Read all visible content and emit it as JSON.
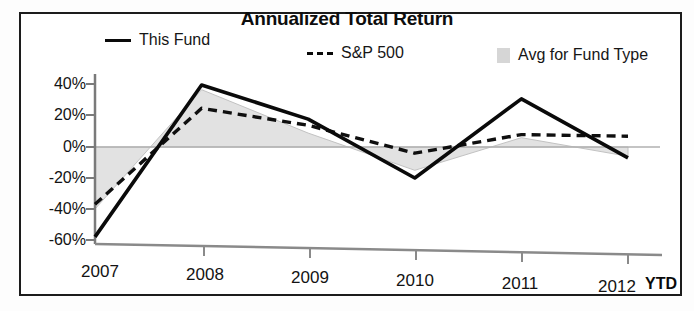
{
  "chart_data": {
    "type": "line",
    "title": "Annualized Total Return",
    "subtitle": "",
    "xlabel": "",
    "ylabel": "",
    "x_axis_note": "YTD",
    "categories": [
      "2007",
      "2008",
      "2009",
      "2010",
      "2011",
      "2012"
    ],
    "tick_labels_y": [
      "40%",
      "20%",
      "0%",
      "-20%",
      "-40%",
      "-60%"
    ],
    "ylim": [
      -60,
      40
    ],
    "ytick_values": [
      40,
      20,
      0,
      -20,
      -40,
      -60
    ],
    "grid": false,
    "legend_position": "top",
    "series": [
      {
        "name": "This Fund",
        "style": "solid-line",
        "color": "#0a0a0a",
        "values": [
          -58,
          40,
          18,
          -20,
          31,
          -7
        ]
      },
      {
        "name": "S&P 500",
        "style": "dashed-line",
        "color": "#0a0a0a",
        "values": [
          -37,
          25,
          14,
          -4,
          8,
          7
        ]
      },
      {
        "name": "Avg for Fund Type",
        "style": "shaded-area",
        "color": "#d6d6d6",
        "values": [
          -40,
          37,
          9,
          -15,
          6,
          -6
        ]
      }
    ]
  },
  "chart": {
    "title": "Annualized Total Return",
    "ytd_label": "YTD",
    "legend": [
      {
        "label": "This Fund",
        "icon": "solid-line-swatch"
      },
      {
        "label": "S&P 500",
        "icon": "dashed-line-swatch"
      },
      {
        "label": "Avg for Fund Type",
        "icon": "shaded-box-swatch"
      }
    ],
    "y_ticks": [
      "40%",
      "20%",
      "0%",
      "-20%",
      "-40%",
      "-60%"
    ],
    "x_ticks": [
      "2007",
      "2008",
      "2009",
      "2010",
      "2011",
      "2012"
    ],
    "colors": {
      "line": "#0a0a0a",
      "area_fill": "#e2e2e2",
      "area_edge": "#bcbcbc",
      "axis": "#6e6e6e",
      "frame": "#1c1c1c",
      "text": "#131313"
    }
  }
}
